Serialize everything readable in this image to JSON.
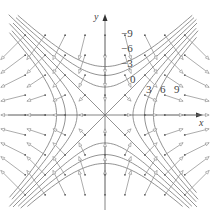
{
  "figure": {
    "axes": {
      "x_label": "x",
      "y_label": "y"
    },
    "level_labels": [
      {
        "text": "−9",
        "x": 121,
        "y": 34
      },
      {
        "text": "−6",
        "x": 121,
        "y": 49
      },
      {
        "text": "−3",
        "x": 121,
        "y": 64
      },
      {
        "text": "0",
        "x": 130,
        "y": 80
      },
      {
        "text": "3",
        "x": 146,
        "y": 90
      },
      {
        "text": "6",
        "x": 160,
        "y": 90
      },
      {
        "text": "9",
        "x": 174,
        "y": 90
      }
    ],
    "levels": [
      -9,
      -6,
      -3,
      0,
      3,
      6,
      9
    ],
    "colors": {
      "lines": "#777777",
      "arrows": "#888888"
    }
  }
}
